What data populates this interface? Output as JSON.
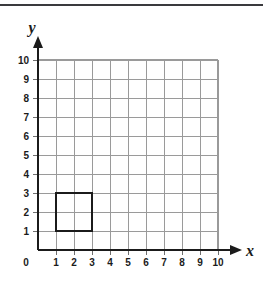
{
  "figure": {
    "title": "",
    "background_color": "#ffffff",
    "top_rule_color": "#3a3a3e"
  },
  "axes": {
    "x_name": "x",
    "y_name": "y",
    "origin_label": "0",
    "x_tick_labels": [
      "1",
      "2",
      "3",
      "4",
      "5",
      "6",
      "7",
      "8",
      "9",
      "10"
    ],
    "y_tick_labels": [
      "1",
      "2",
      "3",
      "4",
      "5",
      "6",
      "7",
      "8",
      "9",
      "10"
    ],
    "axis_color": "#1b1b1b",
    "grid_color": "#9a9a9a"
  },
  "chart_data": {
    "type": "scatter",
    "title": "",
    "xlabel": "x",
    "ylabel": "y",
    "xlim": [
      0,
      10
    ],
    "ylim": [
      0,
      10
    ],
    "xticks": [
      0,
      1,
      2,
      3,
      4,
      5,
      6,
      7,
      8,
      9,
      10
    ],
    "yticks": [
      0,
      1,
      2,
      3,
      4,
      5,
      6,
      7,
      8,
      9,
      10
    ],
    "grid": true,
    "legend": "none",
    "shapes": [
      {
        "name": "square",
        "kind": "polygon",
        "closed": true,
        "stroke": "#1b1b1b",
        "stroke_width": 2,
        "fill": "none",
        "vertices": [
          [
            1,
            1
          ],
          [
            3,
            1
          ],
          [
            3,
            3
          ],
          [
            1,
            3
          ]
        ],
        "side_length": 2
      }
    ]
  }
}
